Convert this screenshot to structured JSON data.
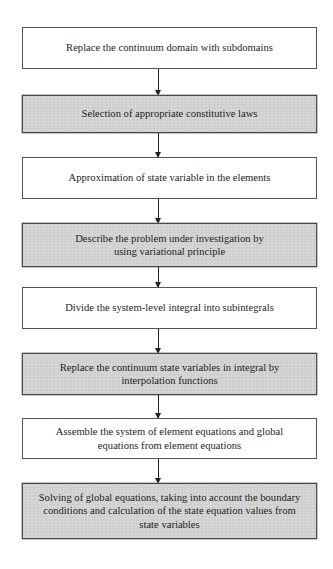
{
  "diagram": {
    "type": "flowchart",
    "direction": "top-to-bottom",
    "colors": {
      "box_white": "#ffffff",
      "box_gray": "#d2d2d2",
      "border": "#555555",
      "arrow": "#222222",
      "text": "#1e1e1e"
    },
    "steps": [
      {
        "label": "Replace the continuum domain with subdomains",
        "style": "white"
      },
      {
        "label": "Selection of appropriate constitutive laws",
        "style": "gray"
      },
      {
        "label": "Approximation of state variable in the elements",
        "style": "white"
      },
      {
        "label": "Describe the problem under investigation by using variational principle",
        "style": "gray"
      },
      {
        "label": "Divide the system-level integral into subintegrals",
        "style": "white"
      },
      {
        "label": "Replace the continuum state variables in integral by interpolation functions",
        "style": "gray"
      },
      {
        "label": "Assemble the system of element equations and global equations from element equations",
        "style": "white"
      },
      {
        "label": "Solving of global equations, taking into account the boundary conditions and calculation of the state equation values from state variables",
        "style": "gray"
      }
    ],
    "connections": [
      {
        "from": 0,
        "to": 1
      },
      {
        "from": 1,
        "to": 2
      },
      {
        "from": 2,
        "to": 3
      },
      {
        "from": 3,
        "to": 4
      },
      {
        "from": 4,
        "to": 5
      },
      {
        "from": 5,
        "to": 6
      },
      {
        "from": 6,
        "to": 7
      }
    ]
  }
}
